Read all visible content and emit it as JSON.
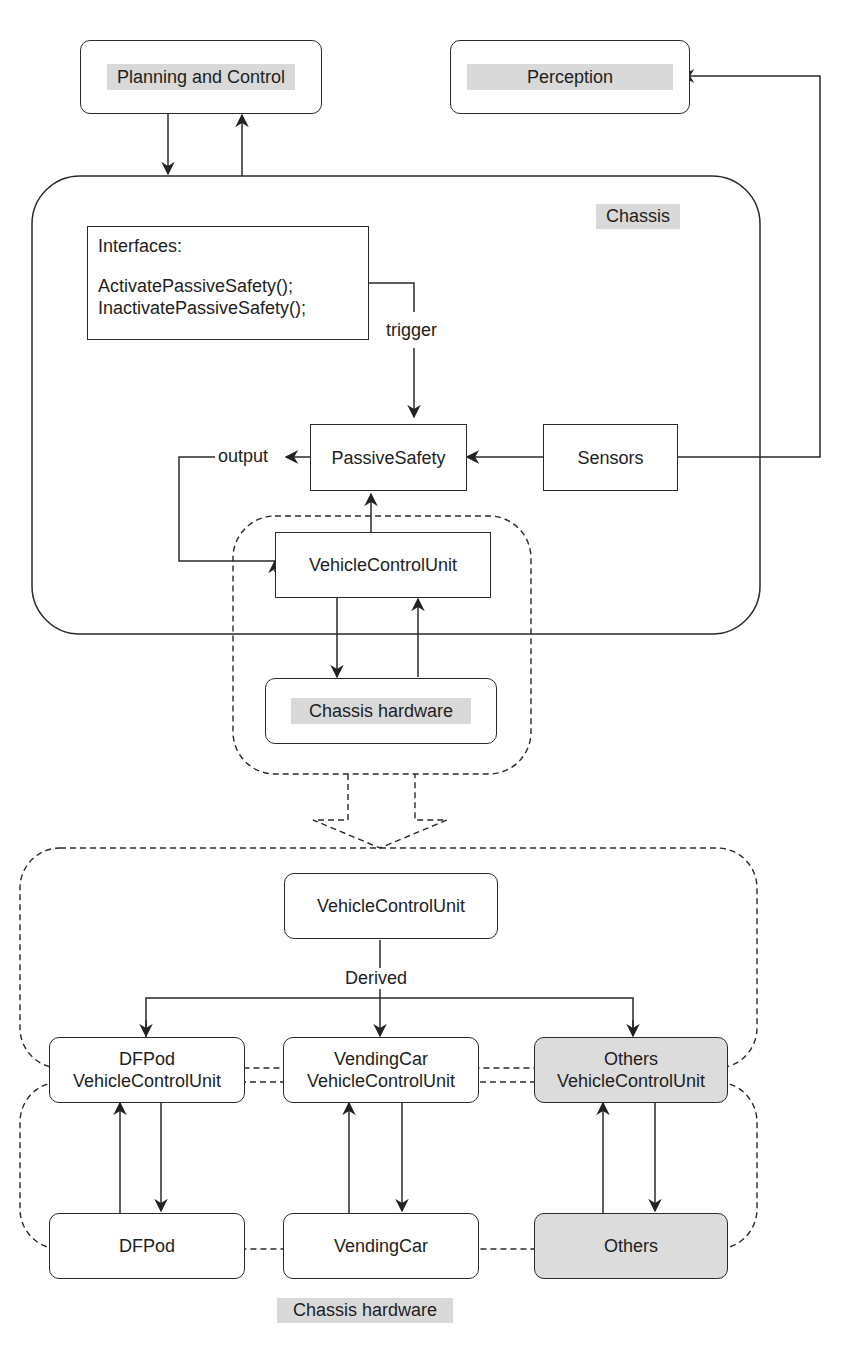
{
  "top": {
    "planning_and_control": "Planning and Control",
    "perception": "Perception"
  },
  "chassis": {
    "title": "Chassis",
    "interfaces": {
      "heading": "Interfaces:",
      "methods": [
        "ActivatePassiveSafety();",
        "InactivatePassiveSafety();"
      ]
    },
    "trigger_label": "trigger",
    "output_label": "output",
    "passive_safety": "PassiveSafety",
    "sensors": "Sensors",
    "vehicle_control_unit": "VehicleControlUnit",
    "chassis_hardware": "Chassis hardware"
  },
  "derived_section": {
    "base": "VehicleControlUnit",
    "derived_label": "Derived",
    "children": [
      {
        "line1": "DFPod",
        "line2": "VehicleControlUnit",
        "shaded": false
      },
      {
        "line1": "VendingCar",
        "line2": "VehicleControlUnit",
        "shaded": false
      },
      {
        "line1": "Others",
        "line2": "VehicleControlUnit",
        "shaded": true
      }
    ]
  },
  "hardware_section": {
    "title": "Chassis hardware",
    "items": [
      "DFPod",
      "VendingCar",
      "Others"
    ]
  }
}
